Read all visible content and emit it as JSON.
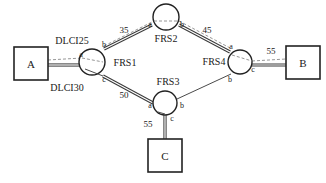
{
  "diagram": {
    "background_color": "#ffffff",
    "line_color": "#222222",
    "devices": [
      {
        "id": "A",
        "label": "A",
        "shape": "square",
        "x": 31,
        "y": 63
      },
      {
        "id": "B",
        "label": "B",
        "shape": "square",
        "x": 303,
        "y": 62
      },
      {
        "id": "C",
        "label": "C",
        "shape": "square",
        "x": 165,
        "y": 155
      }
    ],
    "switches": [
      {
        "id": "FRS1",
        "label": "FRS1",
        "shape": "circle",
        "x": 92,
        "y": 62,
        "ports": [
          {
            "name": "a",
            "position": "left"
          },
          {
            "name": "b",
            "position": "top-right"
          },
          {
            "name": "c",
            "position": "bottom-right"
          }
        ]
      },
      {
        "id": "FRS2",
        "label": "FRS2",
        "shape": "circle",
        "x": 166,
        "y": 17,
        "ports": [
          {
            "name": "a",
            "position": "bottom-left"
          },
          {
            "name": "b",
            "position": "bottom-right"
          }
        ]
      },
      {
        "id": "FRS3",
        "label": "FRS3",
        "shape": "circle",
        "x": 165,
        "y": 103,
        "ports": [
          {
            "name": "a",
            "position": "left"
          },
          {
            "name": "b",
            "position": "right"
          },
          {
            "name": "c",
            "position": "bottom"
          }
        ]
      },
      {
        "id": "FRS4",
        "label": "FRS4",
        "shape": "circle",
        "x": 240,
        "y": 62,
        "ports": [
          {
            "name": "a",
            "position": "top-left"
          },
          {
            "name": "b",
            "position": "bottom-left"
          },
          {
            "name": "c",
            "position": "right"
          }
        ]
      }
    ],
    "links": [
      {
        "from": "A",
        "to": "FRS1",
        "style": "thick",
        "label": ""
      },
      {
        "from": "FRS1.b",
        "to": "FRS2.a",
        "style": "thick",
        "label": "35"
      },
      {
        "from": "FRS2.b",
        "to": "FRS4.a",
        "style": "thick",
        "label": "45"
      },
      {
        "from": "FRS1.c",
        "to": "FRS3.a",
        "style": "thick",
        "label": "50"
      },
      {
        "from": "FRS3.b",
        "to": "FRS4.b",
        "style": "thin",
        "label": ""
      },
      {
        "from": "FRS4.c",
        "to": "B",
        "style": "thick",
        "label": "55"
      },
      {
        "from": "FRS3.c",
        "to": "C",
        "style": "thick",
        "label": "55"
      }
    ],
    "dlci_labels": [
      {
        "text": "DLCI25",
        "x": 72,
        "y": 41,
        "describes": "A to FRS1 upper virtual circuit"
      },
      {
        "text": "DLCI30",
        "x": 67,
        "y": 88,
        "describes": "A to FRS1 lower virtual circuit"
      }
    ],
    "port_labels": {
      "frs1_a": "a",
      "frs1_b": "b",
      "frs1_c": "c",
      "frs2_a": "a",
      "frs2_b": "b",
      "frs3_a": "a",
      "frs3_b": "b",
      "frs3_c": "c",
      "frs4_a": "a",
      "frs4_b": "b",
      "frs4_c": "c"
    },
    "link_labels": {
      "frs1_frs2": "35",
      "frs2_frs4": "45",
      "frs1_frs3": "50",
      "frs4_b": "55",
      "frs3_c": "55"
    },
    "switch_labels": {
      "frs1": "FRS1",
      "frs2": "FRS2",
      "frs3": "FRS3",
      "frs4": "FRS4"
    },
    "device_labels": {
      "a": "A",
      "b": "B",
      "c": "C"
    }
  }
}
